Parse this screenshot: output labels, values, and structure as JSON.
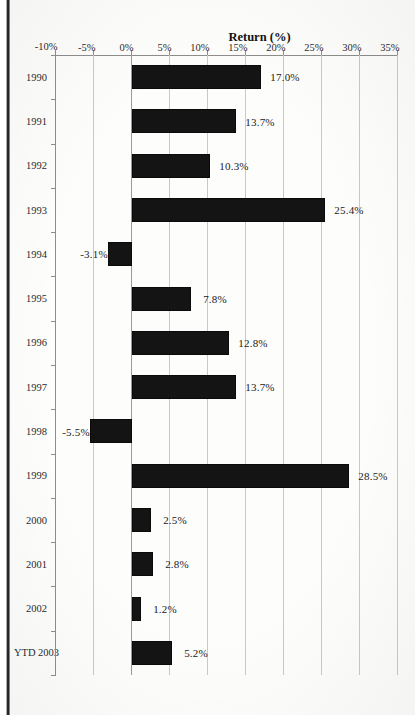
{
  "chart_data": {
    "type": "bar",
    "title": "",
    "subtitle": "",
    "xlabel": "",
    "ylabel": "Return (%)",
    "orientation": "vertical-bars-rotated-page",
    "grid": true,
    "legend": "none",
    "ylim": [
      -10,
      35
    ],
    "ytick_step": 5,
    "ytick_labels": [
      "35%",
      "30%",
      "25%",
      "20%",
      "15%",
      "10%",
      "5%",
      "0%",
      "-5%",
      "-10%"
    ],
    "ytick_values": [
      35,
      30,
      25,
      20,
      15,
      10,
      5,
      0,
      -5,
      -10
    ],
    "categories": [
      "1990",
      "1991",
      "1992",
      "1993",
      "1994",
      "1995",
      "1996",
      "1997",
      "1998",
      "1999",
      "2000",
      "2001",
      "2002",
      "YTD 2003"
    ],
    "values": [
      17.0,
      13.7,
      10.3,
      25.4,
      -3.1,
      7.8,
      12.8,
      13.7,
      -5.5,
      28.5,
      2.5,
      2.8,
      1.2,
      5.2
    ],
    "data_labels": [
      "17.0%",
      "13.7%",
      "10.3%",
      "25.4%",
      "-3.1%",
      "7.8%",
      "12.8%",
      "13.7%",
      "-5.5%",
      "28.5%",
      "2.5%",
      "2.8%",
      "1.2%",
      "5.2%"
    ],
    "bar_color": "#141414",
    "gridline_color": "#c9c9c9",
    "axis_color": "#8d8d8d"
  },
  "page": {
    "scan_edge_label": "page-binding-shadow"
  }
}
